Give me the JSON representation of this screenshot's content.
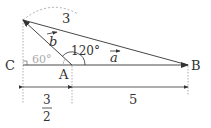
{
  "diagram": {
    "points": {
      "A": {
        "label": "A"
      },
      "B": {
        "label": "B"
      },
      "C": {
        "label": "C"
      }
    },
    "vectors": {
      "a": {
        "label": "a"
      },
      "b": {
        "label": "b"
      }
    },
    "angles": {
      "obtuse": "120°",
      "exterior": "60°"
    },
    "lengths": {
      "tip_to_B": "3",
      "CA_numerator": "3",
      "CA_denominator": "2",
      "AB": "5"
    },
    "colors": {
      "line": "#333333",
      "dotted": "#999999",
      "grey_label": "#aaaaaa"
    }
  }
}
